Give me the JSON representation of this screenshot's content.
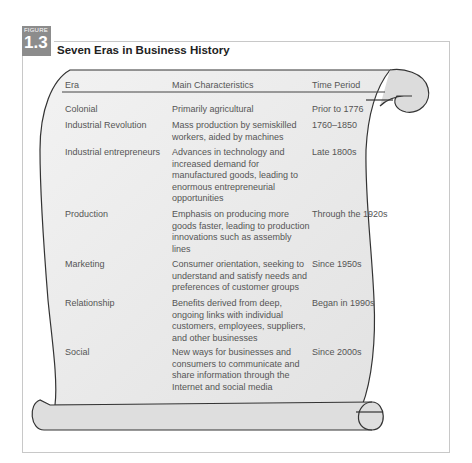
{
  "figure": {
    "label": "FIGURE",
    "number": "1.3",
    "title": "Seven Eras in Business History"
  },
  "table": {
    "headers": [
      "Era",
      "Main Characteristics",
      "Time Period"
    ],
    "rows": [
      {
        "era": "Colonial",
        "characteristics": "Primarily agricultural",
        "period": "Prior to 1776"
      },
      {
        "era": "Industrial Revolution",
        "characteristics": "Mass production by semiskilled workers, aided by machines",
        "period": "1760–1850"
      },
      {
        "era": "Industrial entrepreneurs",
        "characteristics": "Advances in technology and increased demand for manufactured goods, leading to enormous entrepreneurial opportunities",
        "period": "Late 1800s"
      },
      {
        "era": "Production",
        "characteristics": "Emphasis on producing more goods faster, leading to production innovations such as assembly lines",
        "period": "Through the 1920s"
      },
      {
        "era": "Marketing",
        "characteristics": "Consumer orientation, seeking to understand and satisfy needs and preferences of customer groups",
        "period": "Since 1950s"
      },
      {
        "era": "Relationship",
        "characteristics": "Benefits derived from deep, ongoing links with individual customers, employees, suppliers, and other businesses",
        "period": "Began in 1990s"
      },
      {
        "era": "Social",
        "characteristics": "New ways for businesses and consumers to communicate and share information through the Internet and social media",
        "period": "Since 2000s"
      }
    ]
  },
  "colors": {
    "badge": "#8c8c8c",
    "scroll_fill": "#ececec",
    "frame": "#c8c8c8"
  }
}
